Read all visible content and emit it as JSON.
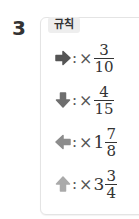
{
  "problem_number": "3",
  "rules_label": "규칙",
  "rules": [
    {
      "icon": "arrow-right-icon",
      "color": "#555555",
      "colon": ":",
      "op": "×",
      "whole": "",
      "numerator": "3",
      "denominator": "10"
    },
    {
      "icon": "arrow-down-icon",
      "color": "#6e6e6e",
      "colon": ":",
      "op": "×",
      "whole": "",
      "numerator": "4",
      "denominator": "15"
    },
    {
      "icon": "arrow-left-icon",
      "color": "#8c8c8c",
      "colon": ":",
      "op": "×",
      "whole": "1",
      "numerator": "7",
      "denominator": "8"
    },
    {
      "icon": "arrow-up-icon",
      "color": "#aaaaaa",
      "colon": ":",
      "op": "×",
      "whole": "3",
      "numerator": "3",
      "denominator": "4"
    }
  ]
}
